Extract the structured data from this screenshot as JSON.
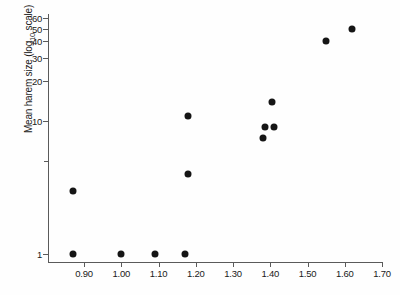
{
  "chart_data": {
    "type": "scatter",
    "title": "",
    "xlabel": "",
    "ylabel": "Mean harem size (log10 scale)",
    "ylabel_parts": {
      "pre": "Mean harem size (log",
      "sub": "10",
      "post": " scale)"
    },
    "xlim": [
      0.83,
      1.73
    ],
    "ylim": [
      1,
      65
    ],
    "yscale": "log10",
    "xscale": "linear",
    "grid": false,
    "legend": null,
    "xticks": [
      0.9,
      1.0,
      1.1,
      1.2,
      1.3,
      1.4,
      1.5,
      1.6,
      1.7
    ],
    "xticklabels": [
      "0.90",
      "1.00",
      "1.10",
      "1.20",
      "1.30",
      "1.40",
      "1.50",
      "1.60",
      "1.70"
    ],
    "yticks": [
      1,
      10,
      20,
      30,
      40,
      50,
      60
    ],
    "yticklabels": [
      "1",
      "10",
      "20",
      "30",
      "40",
      "50",
      "60"
    ],
    "yminorticks": [
      5
    ],
    "marker": "filled-circle",
    "marker_color": "#151515",
    "points": [
      {
        "x": 0.87,
        "y": 1.0
      },
      {
        "x": 1.0,
        "y": 1.0
      },
      {
        "x": 1.09,
        "y": 1.0
      },
      {
        "x": 1.17,
        "y": 1.0
      },
      {
        "x": 0.87,
        "y": 3.0
      },
      {
        "x": 1.18,
        "y": 4.0
      },
      {
        "x": 1.18,
        "y": 11.0
      },
      {
        "x": 1.38,
        "y": 7.5
      },
      {
        "x": 1.385,
        "y": 9.0
      },
      {
        "x": 1.41,
        "y": 9.0
      },
      {
        "x": 1.405,
        "y": 14.0
      },
      {
        "x": 1.55,
        "y": 40.0
      },
      {
        "x": 1.62,
        "y": 50.0
      }
    ],
    "n_points": 13
  }
}
